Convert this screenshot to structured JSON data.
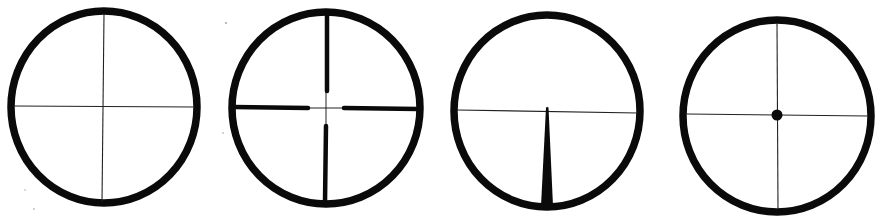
{
  "diagram": {
    "type": "reticle-styles",
    "background": "#ffffff",
    "ink_color": "#0a0a0a",
    "reticles": [
      {
        "id": "fine-crosshair",
        "name": "Fine crosshair",
        "center": [
          104,
          107
        ],
        "radius_x": 93,
        "radius_y": 97,
        "ring_stroke": 8,
        "features": [
          "thin horizontal wire",
          "thin vertical wire"
        ]
      },
      {
        "id": "duplex",
        "name": "Duplex crosshair",
        "center": [
          326,
          108
        ],
        "radius_x": 94,
        "radius_y": 96,
        "ring_stroke": 8,
        "features": [
          "thin center crosshair",
          "four thick posts"
        ],
        "post_gap": {
          "left": 308,
          "right": 344,
          "top": 91,
          "bottom": 126
        }
      },
      {
        "id": "german-post",
        "name": "German #1 post",
        "center": [
          547,
          111
        ],
        "radius_x": 93,
        "radius_y": 96,
        "ring_stroke": 8,
        "features": [
          "thin horizontal wire",
          "tapered bottom post"
        ],
        "post_tip": [
          547,
          107
        ],
        "post_base_width": 12
      },
      {
        "id": "center-dot",
        "name": "Crosshair with center dot",
        "center": [
          777,
          115
        ],
        "radius_x": 94,
        "radius_y": 96,
        "ring_stroke": 8,
        "features": [
          "thin horizontal wire",
          "thin vertical wire",
          "center dot"
        ],
        "dot_radius": 5.5
      }
    ]
  }
}
